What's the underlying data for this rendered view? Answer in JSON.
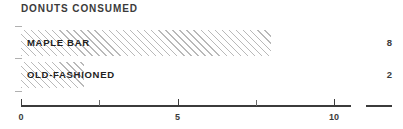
{
  "chart_data": {
    "type": "bar",
    "orientation": "horizontal",
    "title": "DONUTS CONSUMED",
    "categories": [
      "MAPLE BAR",
      "OLD-FASHIONED"
    ],
    "values": [
      8,
      2
    ],
    "value_labels": [
      "8",
      "2"
    ],
    "xlabel": "",
    "ylabel": "",
    "xlim": [
      0,
      10.55
    ],
    "grid": false,
    "legend": null,
    "axis": {
      "tick_values": [
        0,
        2.5,
        5,
        7.5,
        10
      ],
      "tick_labels": [
        "0",
        "",
        "5",
        "",
        "10"
      ],
      "labeled_ticks": [
        {
          "value": 0,
          "label": "0"
        },
        {
          "value": 5,
          "label": "5"
        },
        {
          "value": 10,
          "label": "10"
        }
      ]
    },
    "colors": {
      "bar_hatch": "#b9b9b9",
      "bar_fill": "#ffffff",
      "axis": "#3b3b3b",
      "text": "#222222",
      "title": "#3b3b3b"
    }
  }
}
